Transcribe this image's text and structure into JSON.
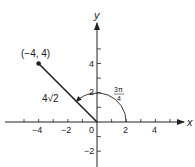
{
  "diagram": {
    "type": "polar-coordinate-plot",
    "axes": {
      "x_label": "x",
      "y_label": "y",
      "x_tick_labels": [
        "−4",
        "−2",
        "0",
        "2",
        "4"
      ],
      "y_tick_labels": [
        "4",
        "2",
        "−2"
      ],
      "x_range": [
        -6,
        6
      ],
      "y_range": [
        -3,
        7
      ]
    },
    "point": {
      "label": "(−4, 4)",
      "x": -4,
      "y": 4
    },
    "segment": {
      "label": "4√2",
      "from": [
        0,
        0
      ],
      "to": [
        -4,
        4
      ]
    },
    "angle_arc": {
      "label_numerator": "3π",
      "label_denominator": "4",
      "radius": 2,
      "start_angle_deg": 0,
      "end_angle_deg": 135
    },
    "colors": {
      "ink": "#222222",
      "background": "#ffffff"
    }
  }
}
